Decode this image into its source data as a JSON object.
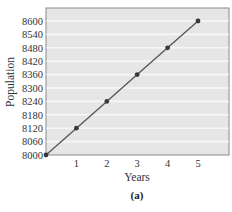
{
  "chart_data": {
    "type": "line",
    "title": "",
    "caption": "(a)",
    "xlabel": "Years",
    "ylabel": "Population",
    "x": [
      0,
      1,
      2,
      3,
      4,
      5
    ],
    "series": [
      {
        "name": "Population",
        "values": [
          8000,
          8120,
          8240,
          8360,
          8480,
          8600
        ]
      }
    ],
    "x_ticks": [
      "1",
      "2",
      "3",
      "4",
      "5"
    ],
    "y_ticks": [
      "8000",
      "8060",
      "8120",
      "8180",
      "8240",
      "8300",
      "8360",
      "8420",
      "8480",
      "8540",
      "8600"
    ],
    "xlim": [
      0,
      6
    ],
    "ylim": [
      8000,
      8660
    ],
    "grid": "horizontal",
    "legend": "none"
  },
  "colors": {
    "plot_background": "#e6e6e6",
    "gridline": "#f7f7f7",
    "frame": "#8a8a8a",
    "line": "#555555",
    "marker": "#3a3a3a"
  }
}
